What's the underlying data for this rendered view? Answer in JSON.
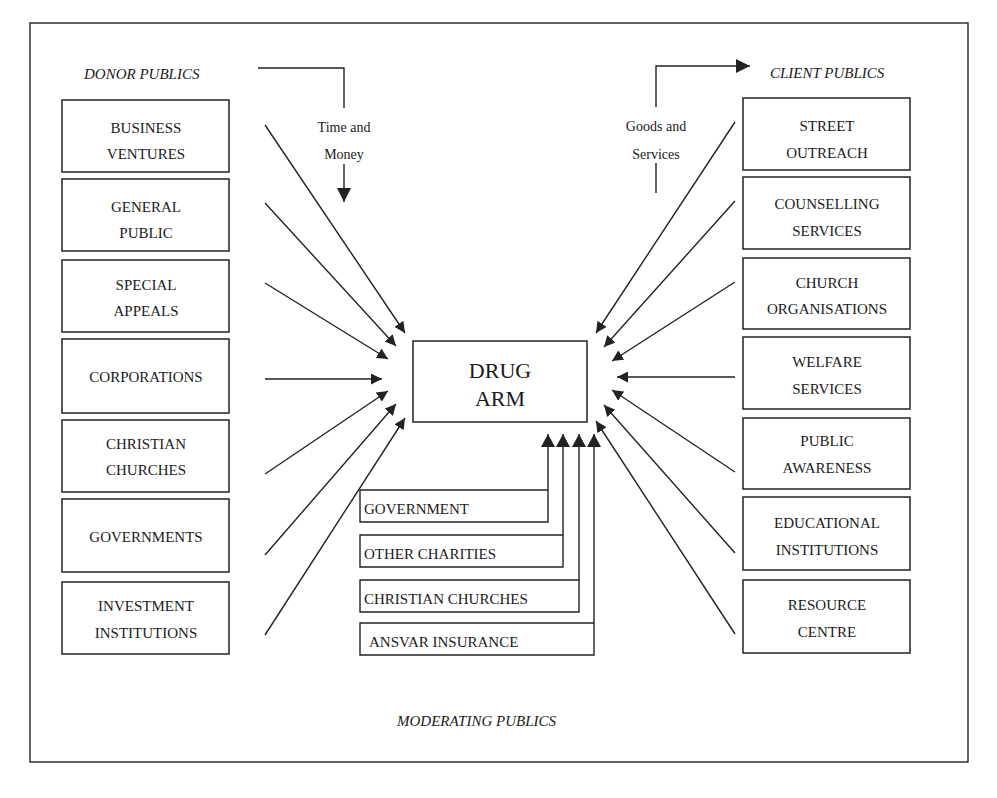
{
  "diagram": {
    "center": {
      "line1": "DRUG",
      "line2": "ARM"
    },
    "donor_publics": {
      "heading": "DONOR PUBLICS",
      "flow_label": {
        "line1": "Time and",
        "line2": "Money"
      },
      "items": [
        {
          "line1": "BUSINESS",
          "line2": "VENTURES"
        },
        {
          "line1": "GENERAL",
          "line2": "PUBLIC"
        },
        {
          "line1": "SPECIAL",
          "line2": "APPEALS"
        },
        {
          "line1": "CORPORATIONS",
          "line2": ""
        },
        {
          "line1": "CHRISTIAN",
          "line2": "CHURCHES"
        },
        {
          "line1": "GOVERNMENTS",
          "line2": ""
        },
        {
          "line1": "INVESTMENT",
          "line2": "INSTITUTIONS"
        }
      ]
    },
    "client_publics": {
      "heading": "CLIENT PUBLICS",
      "flow_label": {
        "line1": "Goods and",
        "line2": "Services"
      },
      "items": [
        {
          "line1": "STREET",
          "line2": "OUTREACH"
        },
        {
          "line1": "COUNSELLING",
          "line2": "SERVICES"
        },
        {
          "line1": "CHURCH",
          "line2": "ORGANISATIONS"
        },
        {
          "line1": "WELFARE",
          "line2": "SERVICES"
        },
        {
          "line1": "PUBLIC",
          "line2": "AWARENESS"
        },
        {
          "line1": "EDUCATIONAL",
          "line2": "INSTITUTIONS"
        },
        {
          "line1": "RESOURCE",
          "line2": "CENTRE"
        }
      ]
    },
    "moderating_publics": {
      "heading": "MODERATING PUBLICS",
      "items": [
        {
          "label": "GOVERNMENT"
        },
        {
          "label": "OTHER CHARITIES"
        },
        {
          "label": "CHRISTIAN CHURCHES"
        },
        {
          "label": "ANSVAR INSURANCE"
        }
      ]
    }
  },
  "caption": "Figure 7.1.1  Drug Arm Network"
}
